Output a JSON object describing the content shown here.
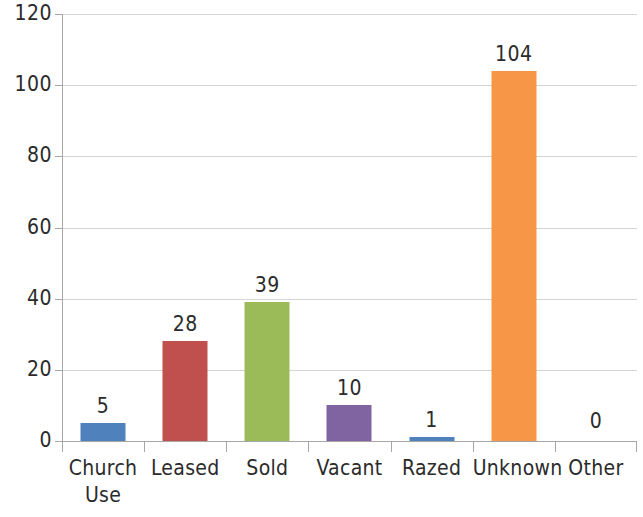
{
  "chart_data": {
    "type": "bar",
    "title": "",
    "subtitle": "",
    "xlabel": "",
    "ylabel": "",
    "categories": [
      "Church Use",
      "Leased",
      "Sold",
      "Vacant",
      "Razed",
      "Unknown",
      "Other"
    ],
    "category_lines": [
      [
        "Church",
        "Use"
      ],
      [
        "Leased"
      ],
      [
        "Sold"
      ],
      [
        "Vacant"
      ],
      [
        "Razed"
      ],
      [
        "Unknown"
      ],
      [
        "Other"
      ]
    ],
    "values": [
      5,
      28,
      39,
      10,
      1,
      104,
      0
    ],
    "data_labels": [
      "5",
      "28",
      "39",
      "10",
      "1",
      "104",
      "0"
    ],
    "bar_colors": [
      "#4F81BD",
      "#C0504D",
      "#9BBB59",
      "#8064A2",
      "#4F81BD",
      "#F79646",
      "#4F81BD"
    ],
    "ylim": [
      0,
      120
    ],
    "y_ticks": [
      0,
      20,
      40,
      60,
      80,
      100,
      120
    ],
    "y_tick_labels": [
      "0",
      "20",
      "40",
      "60",
      "80",
      "100",
      "120"
    ],
    "grid": true,
    "grid_color": "#d4d4d4",
    "axis_color": "#a6a6a6",
    "legend": false,
    "legend_position": "none",
    "plot_background": "#ffffff",
    "text_color": "#2b2b2b"
  }
}
